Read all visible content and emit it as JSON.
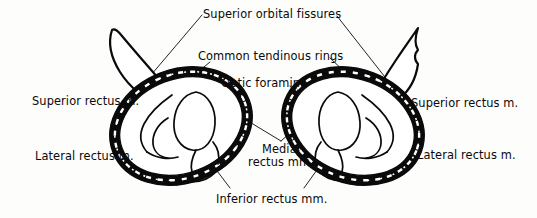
{
  "figure": {
    "background_color": "#fdfdfc",
    "ink_color": "#0a0a0a",
    "style": "black-and-white anatomical line drawing"
  },
  "labels": {
    "superior_orbital_fissures": "Superior orbital fissures",
    "common_tendinous_rings": "Common tendinous rings",
    "optic_foramina": "Optic foramina",
    "superior_rectus_left": "Superior rectus m.",
    "superior_rectus_right": "Superior rectus m.",
    "lateral_rectus_left": "Lateral rectus m.",
    "lateral_rectus_right": "Lateral rectus m.",
    "medial_rectus_line1": "Medial",
    "medial_rectus_line2": "rectus mm.",
    "inferior_rectus": "Inferior rectus mm."
  },
  "structures": {
    "left_orbit": "left common tendinous ring",
    "right_orbit": "right common tendinous ring",
    "left_fissure": "left superior orbital fissure",
    "right_fissure": "right superior orbital fissure",
    "left_foramen": "left optic foramen",
    "right_foramen": "right optic foramen"
  }
}
